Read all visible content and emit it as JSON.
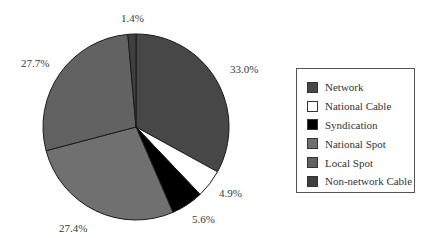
{
  "chart_data": {
    "type": "pie",
    "title": "",
    "start_angle": "12 o'clock, clockwise",
    "slices": [
      {
        "label": "Network",
        "value": 33.0,
        "display": "33.0%",
        "color": "#474747"
      },
      {
        "label": "National Cable",
        "value": 4.9,
        "display": "4.9%",
        "color": "#ffffff"
      },
      {
        "label": "Syndication",
        "value": 5.6,
        "display": "5.6%",
        "color": "#000000"
      },
      {
        "label": "National Spot",
        "value": 27.4,
        "display": "27.4%",
        "color": "#707070"
      },
      {
        "label": "Local Spot",
        "value": 27.7,
        "display": "27.7%",
        "color": "#626262"
      },
      {
        "label": "Non-network Cable",
        "value": 1.4,
        "display": "1.4%",
        "color": "#3f3f3f"
      }
    ],
    "legend_position": "right",
    "grid": false
  },
  "labels": {
    "network": "33.0%",
    "national_cable": "4.9%",
    "syndication": "5.6%",
    "national_spot": "27.4%",
    "local_spot": "27.7%",
    "non_network_cable": "1.4%"
  },
  "legend": {
    "items": [
      {
        "label": "Network",
        "color": "#474747"
      },
      {
        "label": "National Cable",
        "color": "#ffffff"
      },
      {
        "label": "Syndication",
        "color": "#000000"
      },
      {
        "label": "National Spot",
        "color": "#707070"
      },
      {
        "label": "Local Spot",
        "color": "#626262"
      },
      {
        "label": "Non-network Cable",
        "color": "#3f3f3f"
      }
    ]
  }
}
